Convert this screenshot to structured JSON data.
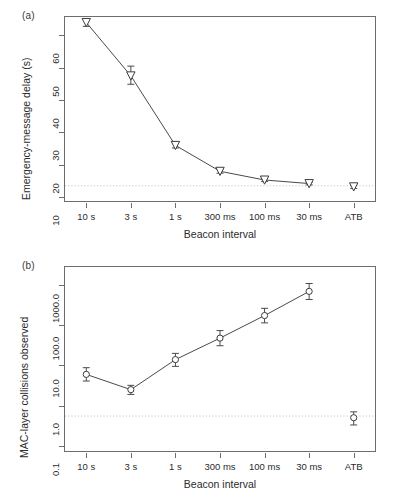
{
  "figure": {
    "panels": [
      {
        "tag": "(a)",
        "chart_data": {
          "type": "line",
          "title": "",
          "xlabel": "Beacon interval",
          "ylabel": "Emergency-message delay (s)",
          "yscale": "linear",
          "ylim": [
            8.5,
            66
          ],
          "yticks": [
            10,
            20,
            30,
            40,
            50,
            60
          ],
          "ytick_labels": [
            "10",
            "20",
            "30",
            "40",
            "50",
            "60"
          ],
          "categories": [
            "10 s",
            "3 s",
            "1 s",
            "300 ms",
            "100 ms",
            "30 ms",
            "ATB"
          ],
          "values": [
            64.0,
            47.5,
            26.0,
            18.0,
            15.3,
            14.2,
            13.2
          ],
          "err_low": [
            1.2,
            2.6,
            0.8,
            0.6,
            0.5,
            0.4,
            0.5
          ],
          "err_high": [
            1.2,
            3.0,
            0.9,
            0.7,
            0.5,
            0.4,
            0.5
          ],
          "marker": "triangle-down",
          "connected_upto_index": 5,
          "refline_value": 13.5,
          "grid": false,
          "legend": "none"
        }
      },
      {
        "tag": "(b)",
        "chart_data": {
          "type": "line",
          "title": "",
          "xlabel": "Beacon interval",
          "ylabel": "MAC-layer collisions observed",
          "yscale": "log",
          "ylim": [
            0.07,
            3000
          ],
          "yticks": [
            0.1,
            1.0,
            10.0,
            100.0,
            1000.0
          ],
          "ytick_labels": [
            "0.1",
            "1.0",
            "10.0",
            "100.0",
            "1000.0"
          ],
          "categories": [
            "10 s",
            "3 s",
            "1 s",
            "300 ms",
            "100 ms",
            "30 ms",
            "ATB"
          ],
          "values": [
            6.0,
            2.5,
            14.0,
            48.0,
            175.0,
            700.0,
            0.5
          ],
          "err_low": [
            1.9,
            0.6,
            4.5,
            17.0,
            60.0,
            260.0,
            0.17
          ],
          "err_high": [
            2.8,
            0.7,
            6.0,
            26.0,
            90.0,
            400.0,
            0.2
          ],
          "marker": "circle-open",
          "connected_upto_index": 5,
          "refline_value": 0.55,
          "grid": false,
          "legend": "none"
        }
      }
    ]
  }
}
